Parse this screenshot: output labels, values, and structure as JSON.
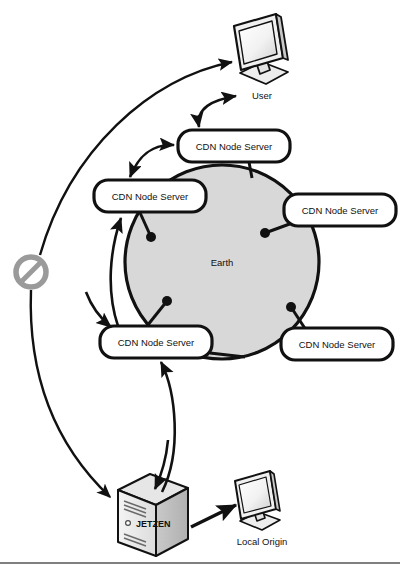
{
  "diagram": {
    "background_color": "#ffffff",
    "stroke_color": "#111111",
    "earth_fill": "#d8d8d8",
    "device_fill": "#e8e8e8",
    "blocked_icon_color": "#9a9a9a",
    "rule_color": "#555555"
  },
  "nodes": {
    "cdn_top": {
      "label": "CDN Node Server"
    },
    "cdn_left": {
      "label": "CDN Node Server"
    },
    "cdn_right": {
      "label": "CDN Node Server"
    },
    "cdn_bottom_left": {
      "label": "CDN Node Server"
    },
    "cdn_bottom_right": {
      "label": "CDN Node Server"
    }
  },
  "earth": {
    "label": "Earth"
  },
  "user": {
    "label": "User",
    "icon": "monitor-icon"
  },
  "local_origin": {
    "label": "Local Origin",
    "icon": "monitor-icon"
  },
  "origin_server": {
    "brand": "JETZEN",
    "icon": "tower-server-icon"
  },
  "blocked_marker": {
    "icon": "no-entry-icon",
    "label": ""
  }
}
